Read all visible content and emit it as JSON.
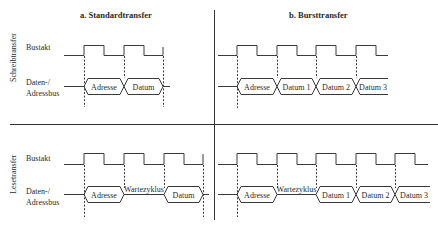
{
  "panels": {
    "a": {
      "title": "a. Standardtransfer"
    },
    "b": {
      "title": "b. Bursttransfer"
    }
  },
  "rows": {
    "write": {
      "label": "Schreibtransfer"
    },
    "read": {
      "label": "Lesetransfer"
    }
  },
  "signals": {
    "clock": "Bustakt",
    "bus_line1": "Daten-/",
    "bus_line2": "Adressbus"
  },
  "segments": {
    "write_standard": [
      "Adresse",
      "Datum"
    ],
    "write_burst": [
      "Adresse",
      "Datum 1",
      "Datum 2",
      "Datum 3"
    ],
    "read_standard": [
      "Adresse",
      "Wartezyklus",
      "Datum"
    ],
    "read_burst": [
      "Adresse",
      "Wartezyklus",
      "Datum 1",
      "Datum 2",
      "Datum 3"
    ]
  },
  "colors": {
    "line": "#3a3a3a",
    "text": "#2a2a2a",
    "background": "#ffffff"
  }
}
